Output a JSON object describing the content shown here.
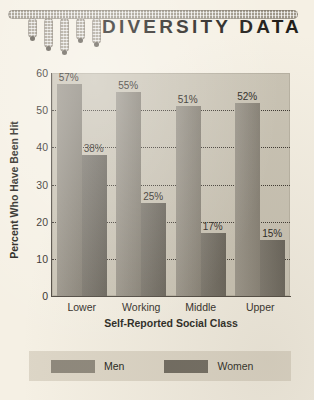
{
  "header": {
    "title": "DIVERSITY DATA",
    "decoration_name": "bar-chart-ornament"
  },
  "chart_data": {
    "type": "bar",
    "title": "DIVERSITY DATA",
    "categories": [
      "Lower",
      "Working",
      "Middle",
      "Upper"
    ],
    "series": [
      {
        "name": "Men",
        "values": [
          57,
          55,
          51,
          52
        ],
        "color": "#8e887c",
        "labels": [
          "57%",
          "55%",
          "51%",
          "52%"
        ]
      },
      {
        "name": "Women",
        "values": [
          38,
          25,
          17,
          15
        ],
        "color": "#6d685e",
        "labels": [
          "38%",
          "25%",
          "17%",
          "15%"
        ]
      }
    ],
    "xlabel": "Self-Reported Social Class",
    "ylabel": "Percent Who Have Been Hit",
    "ylim": [
      0,
      60
    ],
    "yticks": [
      0,
      10,
      20,
      30,
      40,
      50,
      60
    ],
    "ytick_labels": [
      "0",
      "10",
      "20",
      "30",
      "40",
      "50",
      "60"
    ],
    "grid": true,
    "grid_style": "dotted-horizontal",
    "legend_position": "bottom",
    "plot_background": "#c9c3b4",
    "page_background": "#f5f0e4"
  },
  "legend": {
    "items": [
      {
        "label": "Men",
        "color": "#8e887c"
      },
      {
        "label": "Women",
        "color": "#6d685e"
      }
    ]
  }
}
